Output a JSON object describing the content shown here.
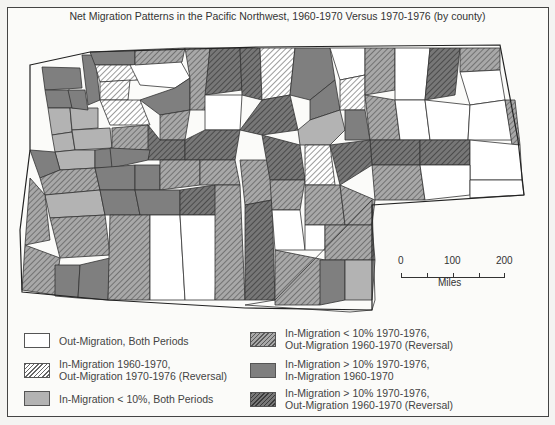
{
  "title": "Net Migration Patterns in the Pacific Northwest, 1960-1970 Versus 1970-1976 (by county)",
  "colors": {
    "out_both": "#ffffff",
    "rev_in60_out70": "#ffffff+hatch",
    "in_lt10_both": "#b3b3b3",
    "in_lt10_rev": "#a8a8a8+hatch",
    "in_gt10_both": "#7f7f7f",
    "in_gt10_rev": "#777777+hatch",
    "border": "#444444"
  },
  "legend": {
    "items": [
      {
        "key": "out_both",
        "label_lines": [
          "Out-Migration, Both Periods"
        ]
      },
      {
        "key": "rev_in60_out70",
        "label_lines": [
          "In-Migration 1960-1970,",
          "Out-Migration 1970-1976 (Reversal)"
        ]
      },
      {
        "key": "in_lt10_both",
        "label_lines": [
          "In-Migration < 10%, Both Periods"
        ]
      },
      {
        "key": "in_lt10_rev",
        "label_lines": [
          "In-Migration < 10% 1970-1976,",
          "Out-Migration 1960-1970 (Reversal)"
        ]
      },
      {
        "key": "in_gt10_both",
        "label_lines": [
          "In-Migration > 10% 1970-1976,",
          "In-Migration 1960-1970"
        ]
      },
      {
        "key": "in_gt10_rev",
        "label_lines": [
          "In-Migration > 10% 1970-1976,",
          "Out-Migration 1960-1970 (Reversal)"
        ]
      }
    ]
  },
  "scale": {
    "ticks": [
      "0",
      "100",
      "200"
    ],
    "unit": "Miles"
  }
}
